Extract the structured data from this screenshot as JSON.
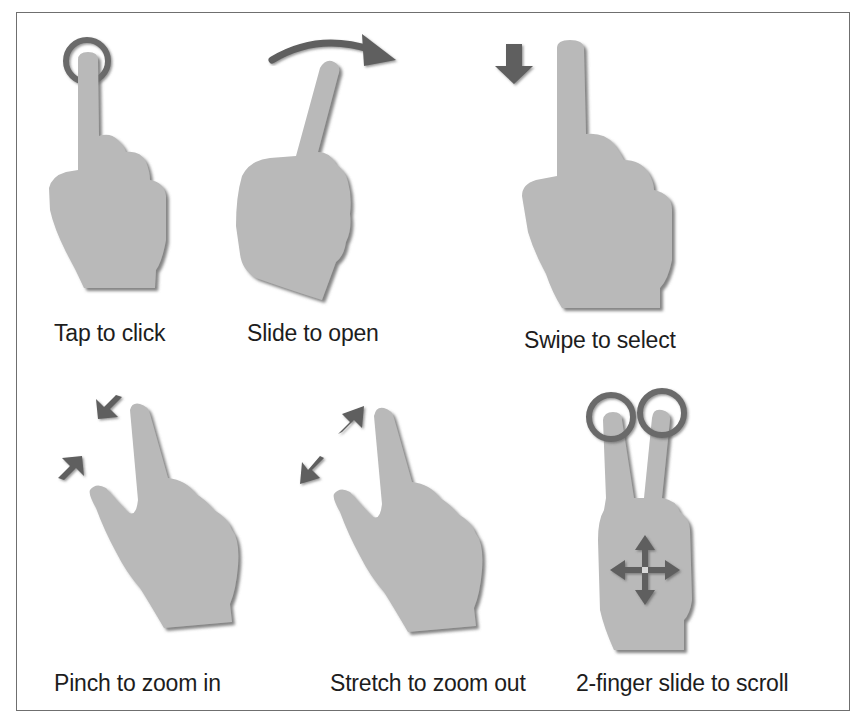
{
  "figure": {
    "colors": {
      "hand_fill": "#b9b9b9",
      "hand_shadow": "#8a8a8a",
      "arrow": "#5f5f5f",
      "ring": "#6a6a6a",
      "border": "#6f6f6f",
      "text": "#1d1d1d"
    },
    "gestures": [
      {
        "id": "tap",
        "label": "Tap to click",
        "icon": "hand-tap-icon",
        "indicator": "ring-icon"
      },
      {
        "id": "slide",
        "label": "Slide to open",
        "icon": "hand-slide-icon",
        "indicator": "curved-arrow-right-icon"
      },
      {
        "id": "swipe",
        "label": "Swipe to select",
        "icon": "hand-swipe-icon",
        "indicator": "arrow-down-icon"
      },
      {
        "id": "pinch",
        "label": "Pinch to zoom in",
        "icon": "hand-pinch-icon",
        "indicator": "arrows-inward-icon"
      },
      {
        "id": "stretch",
        "label": "Stretch to zoom out",
        "icon": "hand-stretch-icon",
        "indicator": "arrows-outward-icon"
      },
      {
        "id": "two-finger-scroll",
        "label": "2-finger slide to scroll",
        "icon": "hand-two-finger-icon",
        "indicator": "move-cross-icon"
      }
    ]
  }
}
